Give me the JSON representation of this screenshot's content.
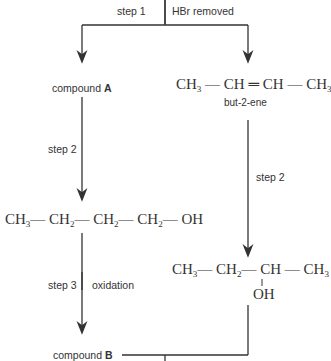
{
  "diagram": {
    "step1": {
      "label": "step 1",
      "note": "HBr removed"
    },
    "left_branch": {
      "compound_a": {
        "prefix": "compound ",
        "bold": "A"
      },
      "step2_label": "step 2",
      "alcohol": "CH3—CH2—CH2—CH2—OH",
      "step3_label": "step 3",
      "step3_note": "oxidation",
      "compound_b": {
        "prefix": "compound ",
        "bold": "B"
      }
    },
    "right_branch": {
      "alkene": "CH3—CH=CH—CH3",
      "alkene_name": "but-2-ene",
      "step2_label": "step 2",
      "alcohol": "CH3—CH2—CH(OH)—CH3",
      "oh_label": "OH"
    },
    "colors": {
      "line": "#333333",
      "text": "#333333"
    }
  }
}
